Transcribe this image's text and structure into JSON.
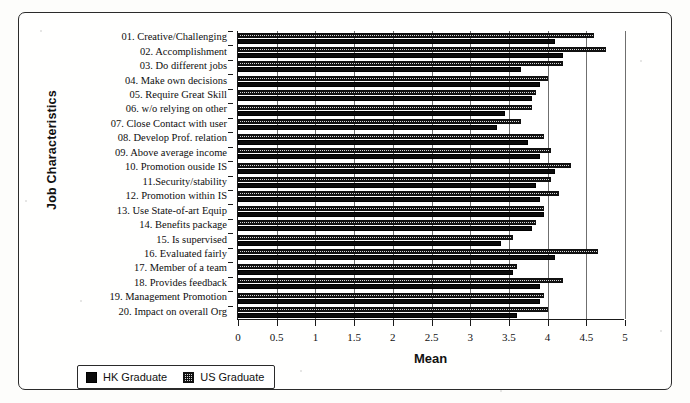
{
  "chart_data": {
    "type": "bar",
    "orientation": "horizontal",
    "title": "",
    "xlabel": "Mean",
    "ylabel": "Job Characteristics",
    "xlim": [
      0,
      5
    ],
    "xticks": [
      "0",
      "0.5",
      "1",
      "1.5",
      "2",
      "2.5",
      "3",
      "3.5",
      "4",
      "4.5",
      "5"
    ],
    "grid": true,
    "legend_position": "bottom-left",
    "categories": [
      "01. Creative/Challenging",
      "02. Accomplishment",
      "03. Do different jobs",
      "04. Make own decisions",
      "05. Require Great Skill",
      "06. w/o relying on other",
      "07. Close Contact with user",
      "08. Develop Prof. relation",
      "09. Above average income",
      "10. Promotion ouside IS",
      "11.Security/stability",
      "12. Promotion within IS",
      "13. Use State-of-art Equip",
      "14. Benefits package",
      "15. Is supervised",
      "16. Evaluated fairly",
      "17. Member of a team",
      "18. Provides feedback",
      "19. Management Promotion",
      "20. Impact on overall Org"
    ],
    "series": [
      {
        "name": "HK Graduate",
        "color": "#0b0b0b",
        "values": [
          4.1,
          4.2,
          3.65,
          3.9,
          3.8,
          3.45,
          3.35,
          3.75,
          3.9,
          4.1,
          3.85,
          3.9,
          3.95,
          3.8,
          3.4,
          4.1,
          3.55,
          3.9,
          3.9,
          3.6
        ]
      },
      {
        "name": "US Graduate",
        "color": "#d8d8d8",
        "values": [
          4.6,
          4.75,
          4.2,
          4.0,
          3.85,
          3.8,
          3.65,
          3.95,
          4.05,
          4.3,
          4.05,
          4.15,
          3.95,
          3.85,
          3.55,
          4.65,
          3.6,
          4.2,
          3.95,
          4.0
        ]
      }
    ]
  },
  "axis": {
    "x_title": "Mean",
    "y_title": "Job Characteristics"
  },
  "legend": {
    "items": [
      {
        "label": "HK Graduate",
        "key": "hk"
      },
      {
        "label": "US Graduate",
        "key": "us"
      }
    ]
  }
}
